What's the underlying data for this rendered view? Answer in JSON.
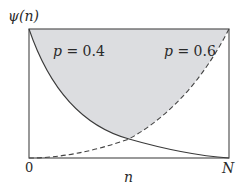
{
  "diagram": {
    "y_axis_label": "ψ(n)",
    "x_axis_label": "n",
    "x_tick_left": "0",
    "x_tick_right": "N",
    "curves": [
      {
        "name": "p = 0.4",
        "p_var": "p",
        "p_eq": " = 0.4",
        "style": "solid",
        "shape": "convex decreasing from 1 at n=0 to 0 at n=N"
      },
      {
        "name": "p = 0.6",
        "p_var": "p",
        "p_eq": " = 0.6",
        "style": "dashed",
        "shape": "convex increasing from 0 at n=0 to 1 at n=N"
      }
    ],
    "shaded_region": "area above the p = 0.4 curve and p = 0.6 curve",
    "colors": {
      "fill": "#dcdde0",
      "line": "#3a3a3a",
      "frame": "#555555"
    }
  }
}
